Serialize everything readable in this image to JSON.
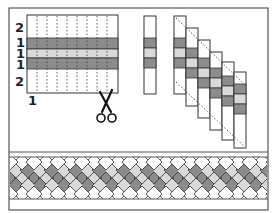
{
  "diagram": {
    "colors": {
      "white": "#ffffff",
      "dark": "#8c8c8c",
      "light": "#d9d9d9",
      "line": "#333333",
      "frame": "#555555"
    },
    "strip_set": {
      "row_labels": [
        "2",
        "1",
        "1",
        "1",
        "2"
      ],
      "bottom_label": "1",
      "bands": [
        "white",
        "dark",
        "light",
        "dark",
        "white"
      ],
      "cut_lines": 8
    },
    "single_strip": {
      "bands": [
        "white",
        "dark",
        "light",
        "dark",
        "white"
      ]
    },
    "staircase": {
      "strip_count": 6,
      "bands": [
        "white",
        "dark",
        "light",
        "dark",
        "white"
      ]
    },
    "braid": {
      "rows": [
        "white",
        "dark",
        "light",
        "dark",
        "white"
      ]
    },
    "icons": [
      "scissors-icon"
    ]
  }
}
